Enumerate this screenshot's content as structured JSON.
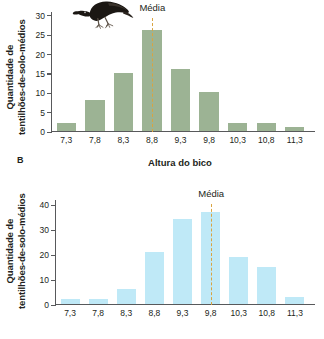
{
  "figure": {
    "panel_letter": "B",
    "bird_illustration_name": "ground-finch-illustration"
  },
  "colors": {
    "bar_top": "#9cb394",
    "bar_bottom": "#bfe9f7",
    "mean_line": "#d9a441",
    "axis": "#58595b",
    "text": "#231f20"
  },
  "chart_data": [
    {
      "id": "top",
      "type": "bar",
      "title": "",
      "xlabel": "Altura do bico",
      "ylabel": "Quantidade de tentilhões-de-solo-médios",
      "ylabel_line1": "Quantidade de",
      "ylabel_line2": "tentilhões-de-solo-médios",
      "categories": [
        "7,3",
        "7,8",
        "8,3",
        "8,8",
        "9,3",
        "9,8",
        "10,3",
        "10,8",
        "11,3"
      ],
      "values": [
        2,
        8,
        15,
        26,
        16,
        10,
        2,
        2,
        1
      ],
      "yticks": [
        0,
        5,
        10,
        15,
        20,
        25,
        30
      ],
      "ylim": [
        0,
        31
      ],
      "grid": false,
      "bar_color": "#9cb394",
      "annotations": [
        {
          "label": "Média",
          "at_category": "8,8",
          "style": "dashed-vertical",
          "color": "#d9a441"
        }
      ]
    },
    {
      "id": "bottom",
      "type": "bar",
      "title": "",
      "xlabel": "",
      "ylabel": "Quantidade de tentilhões-de-solo-médios",
      "ylabel_line1": "Quantidade de",
      "ylabel_line2": "tentilhões-de-solo-médios",
      "categories": [
        "7,3",
        "7,8",
        "8,3",
        "8,8",
        "9,3",
        "9,8",
        "10,3",
        "10,8",
        "11,3"
      ],
      "values": [
        2,
        2,
        6,
        21,
        34,
        37,
        19,
        15,
        3
      ],
      "yticks": [
        0,
        10,
        20,
        30,
        40
      ],
      "ylim": [
        0,
        42
      ],
      "grid": false,
      "bar_color": "#bfe9f7",
      "annotations": [
        {
          "label": "Média",
          "at_category": "9,8",
          "style": "dashed-vertical",
          "color": "#d9a441"
        }
      ]
    }
  ]
}
